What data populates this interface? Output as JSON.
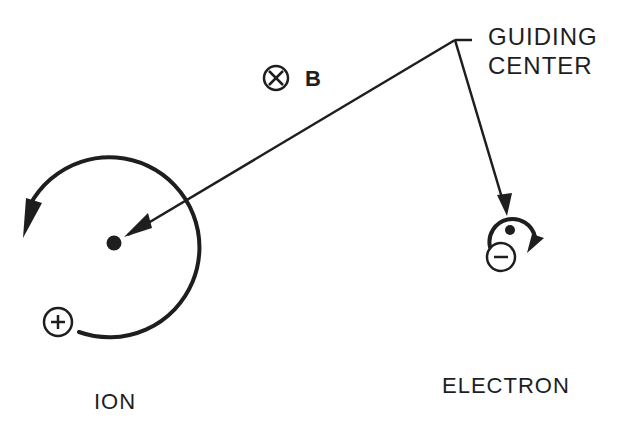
{
  "diagram": {
    "labels": {
      "guiding_center_line1": "GUIDING",
      "guiding_center_line2": "CENTER",
      "magnetic_field": "B",
      "ion": "ION",
      "electron": "ELECTRON"
    },
    "symbols": {
      "field_direction": "⊗ (into page)",
      "ion_charge": "+",
      "electron_charge": "−"
    },
    "colors": {
      "ink": "#1e1e1e",
      "background": "#ffffff"
    }
  }
}
